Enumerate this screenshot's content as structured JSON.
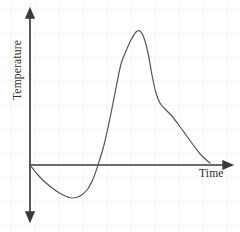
{
  "chart_data": {
    "type": "line",
    "title": "",
    "xlabel": "Time",
    "ylabel": "Temperature",
    "grid": true,
    "grid_spacing_px": 24,
    "legend": null,
    "annotations": [],
    "axis_style": {
      "x_axis_arrow": "right",
      "y_axis_arrow": "both",
      "origin_px": [
        30,
        165
      ],
      "x_axis_end_px": [
        228,
        165
      ],
      "y_axis_top_px": [
        30,
        12
      ],
      "y_axis_bottom_px": [
        30,
        218
      ]
    },
    "xlim": [
      0,
      1
    ],
    "ylim": [
      -0.3,
      1.0
    ],
    "series": [
      {
        "name": "Temperature over time",
        "color": "#565656",
        "line_width": 1.2,
        "description": "Starts at origin, dips below axis to a trough, rises steeply through zero to a sharp peak, then drops quickly and decays gradually back toward the axis.",
        "points_px": [
          [
            30,
            165
          ],
          [
            38,
            175
          ],
          [
            46,
            183
          ],
          [
            55,
            190
          ],
          [
            63,
            195
          ],
          [
            72,
            198
          ],
          [
            80,
            196
          ],
          [
            87,
            190
          ],
          [
            93,
            179
          ],
          [
            98,
            165
          ],
          [
            104,
            145
          ],
          [
            110,
            118
          ],
          [
            116,
            88
          ],
          [
            121,
            64
          ],
          [
            126,
            51
          ],
          [
            131,
            40
          ],
          [
            136,
            32
          ],
          [
            140,
            31
          ],
          [
            144,
            38
          ],
          [
            148,
            53
          ],
          [
            152,
            75
          ],
          [
            156,
            93
          ],
          [
            160,
            103
          ],
          [
            165,
            109
          ],
          [
            171,
            115
          ],
          [
            178,
            124
          ],
          [
            186,
            135
          ],
          [
            194,
            146
          ],
          [
            202,
            156
          ],
          [
            210,
            163
          ]
        ],
        "key_features": {
          "start": [
            0.0,
            0.0
          ],
          "trough": [
            0.21,
            -0.21
          ],
          "zero_crossing_rising": [
            0.34,
            0.0
          ],
          "peak": [
            0.55,
            0.87
          ],
          "steep_drop_end": [
            0.63,
            0.42
          ],
          "end": [
            0.91,
            0.01
          ]
        }
      }
    ],
    "colors": {
      "axis": "#3a3a3a",
      "curve": "#565656",
      "grid": "#f3f1f1",
      "background": "#ffffff",
      "text": "#2e2e2e"
    }
  }
}
